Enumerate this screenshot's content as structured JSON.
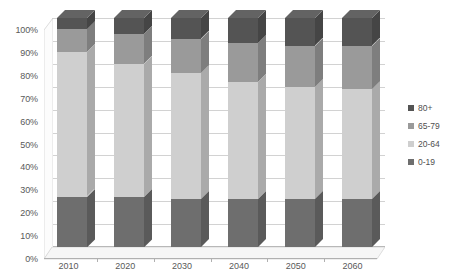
{
  "chart_data": {
    "type": "bar",
    "subtype": "stacked-100-percent-3d",
    "title": "",
    "subtitle": "",
    "xlabel": "",
    "ylabel": "",
    "categories": [
      "2010",
      "2020",
      "2030",
      "2040",
      "2050",
      "2060"
    ],
    "ylim": [
      0,
      100
    ],
    "ytick_labels": [
      "0%",
      "10%",
      "20%",
      "30%",
      "40%",
      "50%",
      "60%",
      "70%",
      "80%",
      "90%",
      "100%"
    ],
    "ytick_values": [
      0,
      10,
      20,
      30,
      40,
      50,
      60,
      70,
      80,
      90,
      100
    ],
    "grid": true,
    "grid_axis": "y",
    "legend_position": "right",
    "stack_order_bottom_to_top": [
      "0-19",
      "20-64",
      "65-79",
      "80+"
    ],
    "series": [
      {
        "name": "0-19",
        "color": "#6e6e6e",
        "values": [
          22,
          22,
          21,
          21,
          21,
          21
        ]
      },
      {
        "name": "20-64",
        "color": "#cfcfcf",
        "values": [
          63,
          58,
          55,
          51,
          49,
          48
        ]
      },
      {
        "name": "65-79",
        "color": "#9a9a9a",
        "values": [
          10,
          13,
          15,
          17,
          18,
          19
        ]
      },
      {
        "name": "80+",
        "color": "#545454",
        "values": [
          5,
          7,
          9,
          11,
          12,
          12
        ]
      }
    ],
    "legend_entries": [
      {
        "label": "80+",
        "color": "#545454"
      },
      {
        "label": "65-79",
        "color": "#9a9a9a"
      },
      {
        "label": "20-64",
        "color": "#cfcfcf"
      },
      {
        "label": "0-19",
        "color": "#6e6e6e"
      }
    ],
    "colors": {
      "plot_background": "#ffffff",
      "gridline": "#d2d2d2",
      "axis": "#b0b0b0",
      "floor": "#f2f2f2",
      "side_wall": "#fbfbfb",
      "axis_text": "#595959"
    }
  }
}
